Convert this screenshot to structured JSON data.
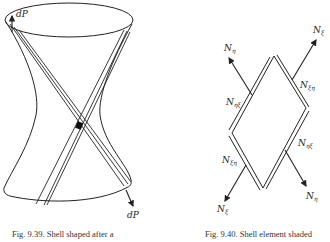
{
  "figures": [
    {
      "id": "left",
      "caption": "Fig. 9.39. Shell shaped after a",
      "labels": {
        "top_force": "dP",
        "bottom_force": "dP"
      }
    },
    {
      "id": "right",
      "caption": "Fig. 9.40. Shell element shaded",
      "labels": {
        "top_left_force": "N",
        "top_left_sub": "η",
        "top_right_force": "N",
        "top_right_sub": "ξ",
        "upper_left_shear": "N",
        "upper_left_shear_sub": "ηξ",
        "upper_right_shear": "N",
        "upper_right_shear_sub": "ξη",
        "lower_left_shear": "N",
        "lower_left_shear_sub": "ξη",
        "lower_right_shear": "N",
        "lower_right_shear_sub": "ηξ",
        "bottom_left_force": "N",
        "bottom_left_sub": "ξ",
        "bottom_right_force": "N",
        "bottom_right_sub": "η"
      }
    }
  ],
  "colors": {
    "ink": "#222222",
    "background": "#ffffff"
  }
}
